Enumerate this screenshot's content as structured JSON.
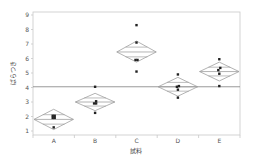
{
  "chart_data": {
    "type": "scatter",
    "subtype": "means-diamonds",
    "title": "",
    "xlabel": "試料",
    "ylabel": "ばらつき",
    "categories": [
      "A",
      "B",
      "C",
      "D",
      "E"
    ],
    "ylim": [
      0.7,
      9
    ],
    "yticks": [
      1,
      2,
      3,
      4,
      5,
      6,
      7,
      8,
      9
    ],
    "grid": false,
    "legend": null,
    "grand_mean": 4.05,
    "groups": [
      {
        "name": "A",
        "points": [
          2.05,
          2.05,
          1.9,
          1.9,
          1.25
        ],
        "mean": 1.8,
        "ci_lower": 1.1,
        "ci_upper": 2.5
      },
      {
        "name": "B",
        "points": [
          4.05,
          3.05,
          2.9,
          2.9,
          2.25
        ],
        "mean": 3.0,
        "ci_lower": 2.4,
        "ci_upper": 3.6
      },
      {
        "name": "C",
        "points": [
          8.3,
          7.1,
          5.9,
          5.9,
          5.1
        ],
        "mean": 6.45,
        "ci_lower": 5.75,
        "ci_upper": 7.2
      },
      {
        "name": "D",
        "points": [
          4.9,
          4.1,
          4.05,
          3.85,
          3.3
        ],
        "mean": 4.05,
        "ci_lower": 3.4,
        "ci_upper": 4.7
      },
      {
        "name": "E",
        "points": [
          5.95,
          5.35,
          5.2,
          4.95,
          4.1
        ],
        "mean": 5.1,
        "ci_lower": 4.45,
        "ci_upper": 5.75
      }
    ]
  },
  "colors": {
    "frame": "#c8c8c8",
    "diamond": "#a0a0a0",
    "grand_mean_line": "#808080",
    "point": "#222222"
  }
}
